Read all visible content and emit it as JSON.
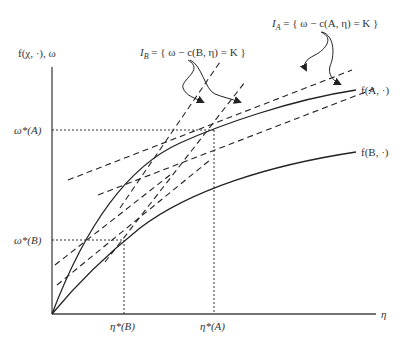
{
  "diagram": {
    "y_axis_label": "f(χ, ·), ω",
    "x_axis_label": "η",
    "curves": [
      {
        "id": "fA",
        "label": "f(A, ·)"
      },
      {
        "id": "fB",
        "label": "f(B, ·)"
      }
    ],
    "y_ticks": [
      {
        "label": "ω*(A)"
      },
      {
        "label": "ω*(B)"
      }
    ],
    "x_ticks": [
      {
        "label": "η*(B)"
      },
      {
        "label": "η*(A)"
      }
    ],
    "isocost_labels": {
      "IA": "I_A = { ω − c(A, η) = K }",
      "IB": "I_B = { ω − c(B, η) = K }"
    },
    "colors": {
      "line": "#222222",
      "text": "#333333",
      "background": "#ffffff"
    }
  },
  "labels": {
    "y_axis": "f(χ, ·),  ω",
    "x_axis": "η",
    "fA": "f(A, ·)",
    "fB": "f(B, ·)",
    "omegaA": "ω*(A)",
    "omegaB": "ω*(B)",
    "etaB": "η*(B)",
    "etaA": "η*(A)",
    "IA_main": "I",
    "IA_sub": "A",
    "IA_rest": " = { ω − c(A, η) = K }",
    "IB_main": "I",
    "IB_sub": "B",
    "IB_rest": " = { ω − c(B, η) = K }"
  }
}
